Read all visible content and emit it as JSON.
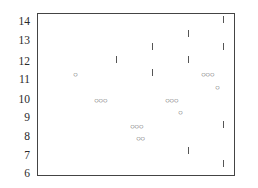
{
  "figure": {
    "y_axis_labels": [
      "14",
      "13",
      "12",
      "11",
      "10",
      "9",
      "8",
      "7",
      "6"
    ],
    "circle_groups": [
      {
        "x": 77,
        "y": 75,
        "glyph": "○"
      },
      {
        "x": 98,
        "y": 101,
        "glyph": "○○○"
      },
      {
        "x": 134,
        "y": 127,
        "glyph": "○○○"
      },
      {
        "x": 140,
        "y": 139,
        "glyph": "○○"
      },
      {
        "x": 169,
        "y": 101,
        "glyph": "○○○"
      },
      {
        "x": 182,
        "y": 113,
        "glyph": "○"
      },
      {
        "x": 205,
        "y": 75,
        "glyph": "○○○"
      },
      {
        "x": 219,
        "y": 88,
        "glyph": "○"
      }
    ],
    "tick_marks": [
      {
        "x": 223,
        "y": 19
      },
      {
        "x": 188,
        "y": 33
      },
      {
        "x": 152,
        "y": 46
      },
      {
        "x": 223,
        "y": 46
      },
      {
        "x": 116,
        "y": 59
      },
      {
        "x": 188,
        "y": 59
      },
      {
        "x": 152,
        "y": 72
      },
      {
        "x": 223,
        "y": 124
      },
      {
        "x": 188,
        "y": 150
      },
      {
        "x": 223,
        "y": 163
      }
    ]
  }
}
